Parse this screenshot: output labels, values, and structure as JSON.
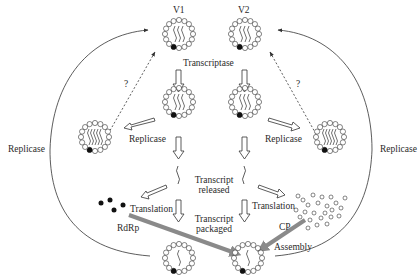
{
  "diagram": {
    "virions": {
      "v1_label": "V1",
      "v2_label": "V2"
    },
    "labels": {
      "transcriptase": "Transcriptase",
      "replicase_left_inner": "Replicase",
      "replicase_right_inner": "Replicase",
      "replicase_left_outer": "Replicase",
      "replicase_right_outer": "Replicase",
      "question_left": "?",
      "question_right": "?",
      "transcript_released_line1": "Transcript",
      "transcript_released_line2": "released",
      "transcript_packaged_line1": "Transcript",
      "transcript_packaged_line2": "packaged",
      "translation_left": "Translation",
      "translation_right": "Translation",
      "rdrp": "RdRp",
      "cp": "CP",
      "assembly": "Assembly"
    },
    "colors": {
      "stroke": "#333333",
      "thick_arrow": "#8a8a8a",
      "background": "#ffffff"
    }
  }
}
